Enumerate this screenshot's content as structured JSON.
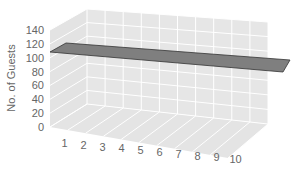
{
  "chart_data": {
    "type": "line",
    "style": "3d-ribbon",
    "title": "",
    "xlabel": "",
    "ylabel": "No. of Guests",
    "categories": [
      "1",
      "2",
      "3",
      "4",
      "5",
      "6",
      "7",
      "8",
      "9",
      "10"
    ],
    "series": [
      {
        "name": "Guests",
        "values": [
          100,
          100,
          100,
          100,
          100,
          100,
          100,
          100,
          100,
          100
        ],
        "color": "#7f7f7f"
      }
    ],
    "ylim": [
      0,
      140
    ],
    "yticks": [
      "0",
      "20",
      "40",
      "60",
      "80",
      "100",
      "120",
      "140"
    ],
    "grid": true,
    "legend": "none"
  },
  "colors": {
    "wall": "#e3e3e3",
    "floor": "#e6e6e6",
    "gridline": "#ffffff",
    "ribbon": "#7f7f7f",
    "ribbon_edge": "#333333",
    "text": "#666666"
  }
}
